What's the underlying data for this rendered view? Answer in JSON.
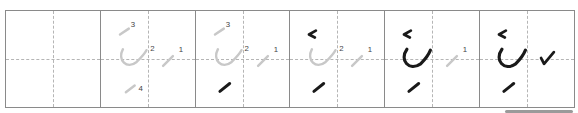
{
  "worksheet": {
    "type": "stroke-order-practice",
    "cell_count": 6,
    "colors": {
      "border": "#8a8a8a",
      "guide": "#b5b5b5",
      "ghost_stroke": "#c8c8c8",
      "ink_stroke": "#1a1a1a",
      "number": "#444444"
    },
    "cells": [
      {
        "index": 0,
        "label": "empty",
        "numbers": []
      },
      {
        "index": 1,
        "label": "all-strokes-ghost",
        "numbers": [
          "1",
          "2",
          "3",
          "4"
        ]
      },
      {
        "index": 2,
        "label": "stroke-4-inked",
        "numbers": [
          "1",
          "2",
          "3"
        ]
      },
      {
        "index": 3,
        "label": "strokes-3-4-inked",
        "numbers": [
          "1",
          "2"
        ]
      },
      {
        "index": 4,
        "label": "strokes-2-3-4-inked",
        "numbers": [
          "1"
        ]
      },
      {
        "index": 5,
        "label": "all-strokes-inked",
        "numbers": []
      }
    ]
  },
  "scrollbar": {
    "visible": true
  }
}
